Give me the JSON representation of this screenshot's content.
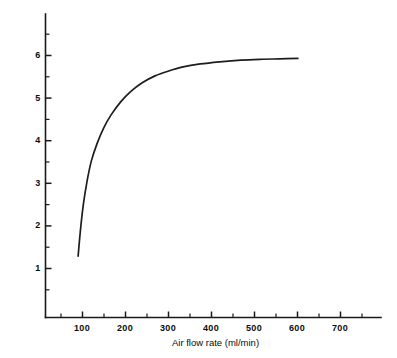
{
  "chart_data": {
    "type": "line",
    "title": "",
    "subtitle": "",
    "xlabel": "Air flow rate (ml/min)",
    "ylabel_parts": {
      "prefix": "Response  × 10",
      "exponent": "−9",
      "suffix": " amperes"
    },
    "ylabel": "Response × 10⁻⁹ amperes",
    "xlim": [
      0,
      780
    ],
    "ylim": [
      0,
      6.75
    ],
    "grid": false,
    "legend": null,
    "annotations": [],
    "x_major_ticks": [
      100,
      200,
      300,
      400,
      500,
      600,
      700
    ],
    "x_major_tick_labels": [
      "100",
      "200",
      "300",
      "400",
      "500",
      "600",
      "700"
    ],
    "x_minor_ticks": [
      50,
      150,
      250,
      350,
      450,
      550,
      650,
      750
    ],
    "y_major_ticks": [
      1,
      2,
      3,
      4,
      5,
      6
    ],
    "y_major_tick_labels": [
      "1",
      "2",
      "3",
      "4",
      "5",
      "6"
    ],
    "y_minor_ticks": [
      0.5,
      1.5,
      2.5,
      3.5,
      4.5,
      5.5,
      6.5
    ],
    "series": [
      {
        "name": "response-curve",
        "color": "#1d1d1d",
        "x": [
          91,
          96,
          103,
          112,
          122,
          135,
          150,
          168,
          190,
          213,
          240,
          270,
          300,
          335,
          375,
          420,
          470,
          520,
          560,
          602
        ],
        "y": [
          1.28,
          1.85,
          2.48,
          3.05,
          3.52,
          3.92,
          4.28,
          4.6,
          4.9,
          5.14,
          5.35,
          5.51,
          5.62,
          5.72,
          5.79,
          5.84,
          5.88,
          5.9,
          5.91,
          5.92
        ]
      }
    ]
  },
  "figure": {
    "background": "#ffffff",
    "axis_color": "#1a1a1a"
  }
}
